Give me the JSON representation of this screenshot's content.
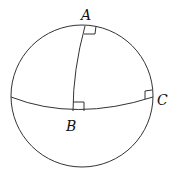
{
  "diagram": {
    "points": {
      "A": {
        "label": "A"
      },
      "B": {
        "label": "B"
      },
      "C": {
        "label": "C"
      }
    },
    "right_angle_markers": [
      "at A",
      "at B",
      "at C"
    ],
    "stroke_color": "#333333"
  }
}
